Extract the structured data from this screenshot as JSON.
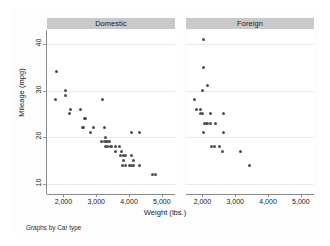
{
  "chart_data": {
    "type": "scatter",
    "title": "",
    "xlabel": "Weight (lbs.)",
    "ylabel": "Mileage (mpg)",
    "note": "Graphs by Car type",
    "xlim": [
      1500,
      5400
    ],
    "ylim": [
      8,
      43
    ],
    "xticks": [
      2000,
      3000,
      4000,
      5000
    ],
    "xticklabels": [
      "2,000",
      "3,000",
      "4,000",
      "5,000"
    ],
    "yticks": [
      10,
      20,
      30,
      40
    ],
    "yticklabels": [
      "10",
      "20",
      "30",
      "40"
    ],
    "grid": "horizontal",
    "legend": "none",
    "marker_color": "#4f4f55",
    "panel_header_color": "#c9c9c9",
    "panels": [
      {
        "label": "Domestic",
        "points": [
          [
            1800,
            34
          ],
          [
            1760,
            28
          ],
          [
            2070,
            30
          ],
          [
            2050,
            29
          ],
          [
            2230,
            26
          ],
          [
            2200,
            25
          ],
          [
            2520,
            26
          ],
          [
            2650,
            24
          ],
          [
            2670,
            24
          ],
          [
            2580,
            22
          ],
          [
            2600,
            22
          ],
          [
            2930,
            22
          ],
          [
            3250,
            22
          ],
          [
            3200,
            28
          ],
          [
            2830,
            21
          ],
          [
            3280,
            20
          ],
          [
            3250,
            19
          ],
          [
            3300,
            19
          ],
          [
            3350,
            19
          ],
          [
            3400,
            19
          ],
          [
            3430,
            18
          ],
          [
            3280,
            18
          ],
          [
            3470,
            18
          ],
          [
            3600,
            18
          ],
          [
            3700,
            18
          ],
          [
            3600,
            17
          ],
          [
            3760,
            17
          ],
          [
            3730,
            16
          ],
          [
            3830,
            16
          ],
          [
            3900,
            16
          ],
          [
            4060,
            16
          ],
          [
            3840,
            15
          ],
          [
            4130,
            15
          ],
          [
            3800,
            14
          ],
          [
            3900,
            14
          ],
          [
            4000,
            14
          ],
          [
            4060,
            14
          ],
          [
            4130,
            14
          ],
          [
            4330,
            14
          ],
          [
            4720,
            12
          ],
          [
            4800,
            12
          ],
          [
            4080,
            21
          ],
          [
            4330,
            21
          ],
          [
            3170,
            19
          ],
          [
            3350,
            18
          ]
        ]
      },
      {
        "label": "Foreign",
        "points": [
          [
            2020,
            41
          ],
          [
            2040,
            35
          ],
          [
            2160,
            31
          ],
          [
            2010,
            30
          ],
          [
            1760,
            28
          ],
          [
            1830,
            26
          ],
          [
            1930,
            25
          ],
          [
            1990,
            25
          ],
          [
            2240,
            25
          ],
          [
            2650,
            25
          ],
          [
            2070,
            23
          ],
          [
            2130,
            23
          ],
          [
            2160,
            23
          ],
          [
            2410,
            23
          ],
          [
            2020,
            21
          ],
          [
            2650,
            21
          ],
          [
            2370,
            18
          ],
          [
            2520,
            18
          ],
          [
            2600,
            17
          ],
          [
            3170,
            17
          ],
          [
            3420,
            14
          ],
          [
            1930,
            26
          ],
          [
            2240,
            23
          ],
          [
            2280,
            18
          ]
        ]
      }
    ]
  }
}
